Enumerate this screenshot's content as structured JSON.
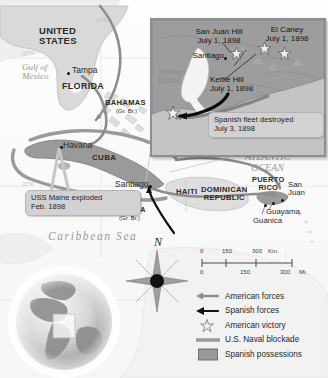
{
  "map": {
    "title": "Spanish-American War in the Caribbean, 1898",
    "colors": {
      "spanish_possession": "#9a9a9a",
      "land": "#d9d9d9",
      "water": "#fbfbfb",
      "american_forces": "#8d8d8d",
      "spanish_forces": "#111111",
      "blockade": "#8d8d8d",
      "callout_fill": "#d2d2d2",
      "inset_fill": "#c9c9c9"
    },
    "grid_labels": [
      {
        "text": "80°W",
        "x": 96,
        "y": 17
      },
      {
        "text": "30°N",
        "x": 22,
        "y": 50
      },
      {
        "text": "20°N",
        "x": 22,
        "y": 181
      }
    ],
    "place_labels": [
      {
        "name": "united-states",
        "text": "UNITED\nSTATES",
        "x": 39,
        "y": 26,
        "size": 9.5,
        "style": "country"
      },
      {
        "name": "florida",
        "text": "FLORIDA",
        "x": 62,
        "y": 82,
        "size": 9,
        "style": "country"
      },
      {
        "name": "tampa",
        "text": "Tampa",
        "x": 72,
        "y": 69,
        "size": 8.5,
        "style": "plain"
      },
      {
        "name": "gulf-of-mexico",
        "text": "Gulf of\nMexico",
        "x": 22,
        "y": 68,
        "size": 9,
        "style": "sea"
      },
      {
        "name": "bahamas",
        "text": "BAHAMAS",
        "x": 105,
        "y": 101,
        "size": 7.6,
        "style": "country"
      },
      {
        "name": "bahamas-sub",
        "text": "(Gr. Br.)",
        "x": 116,
        "y": 110,
        "size": 6,
        "style": "plain"
      },
      {
        "name": "havana",
        "text": "Havana",
        "x": 63,
        "y": 144,
        "size": 8.5,
        "style": "plain"
      },
      {
        "name": "cuba",
        "text": "CUBA",
        "x": 92,
        "y": 156,
        "size": 8,
        "style": "country"
      },
      {
        "name": "santiago",
        "text": "Santiago",
        "x": 118,
        "y": 178,
        "size": 8.5,
        "style": "plain"
      },
      {
        "name": "jamaica",
        "text": "JAMAICA",
        "x": 111,
        "y": 208,
        "size": 7.2,
        "style": "country"
      },
      {
        "name": "jamaica-sub",
        "text": "(Gr. Br.)",
        "x": 119,
        "y": 217,
        "size": 6,
        "style": "plain"
      },
      {
        "name": "haiti",
        "text": "HAITI",
        "x": 178,
        "y": 190,
        "size": 7.6,
        "style": "country"
      },
      {
        "name": "dominican-republic",
        "text": "DOMINICAN\nREPUBLIC",
        "x": 204,
        "y": 190,
        "size": 7.6,
        "style": "country"
      },
      {
        "name": "puerto-rico",
        "text": "PUERTO\nRICO",
        "x": 253,
        "y": 179,
        "size": 7.4,
        "style": "country"
      },
      {
        "name": "san-juan",
        "text": "San\nJuan",
        "x": 287,
        "y": 183,
        "size": 7.8,
        "style": "plain"
      },
      {
        "name": "guayama",
        "text": "Guayama",
        "x": 264,
        "y": 208,
        "size": 7.8,
        "style": "plain"
      },
      {
        "name": "guanica",
        "text": "Guánica",
        "x": 256,
        "y": 217,
        "size": 7.8,
        "style": "plain"
      },
      {
        "name": "atlantic-ocean",
        "text": "ATLANTIC\nOCEAN",
        "x": 245,
        "y": 158,
        "size": 10,
        "style": "sea"
      },
      {
        "name": "caribbean-sea",
        "text": "Caribbean Sea",
        "x": 53,
        "y": 235,
        "size": 11,
        "style": "sea"
      }
    ],
    "city_dots": [
      {
        "name": "tampa-dot",
        "x": 67,
        "y": 72
      },
      {
        "name": "havana-dot",
        "x": 61,
        "y": 146
      },
      {
        "name": "santiago-dot",
        "x": 149,
        "y": 185
      },
      {
        "name": "san-juan-dot",
        "x": 280,
        "y": 200
      },
      {
        "name": "guayama-dot",
        "x": 272,
        "y": 203
      },
      {
        "name": "guanica-dot",
        "x": 265,
        "y": 205
      }
    ],
    "callouts": [
      {
        "name": "uss-maine-callout",
        "line1": "USS Maine exploded",
        "line2": "Feb. 1898",
        "x": 25,
        "y": 190,
        "w": 104
      }
    ],
    "compass": {
      "label": "N",
      "x": 155,
      "y": 238
    }
  },
  "inset": {
    "name": "santiago-battle-inset",
    "x": 150,
    "y": 18,
    "w": 172,
    "h": 135,
    "labels": [
      {
        "name": "san-juan-hill",
        "text": "San Juan Hill",
        "sub": "July 1, 1898",
        "x": 32,
        "y": 10
      },
      {
        "name": "el-caney",
        "text": "El Caney",
        "sub": "July 1, 1898",
        "x": 108,
        "y": 8
      },
      {
        "name": "kettle-hill",
        "text": "Kettle Hill",
        "sub": "July 1, 1898",
        "x": 60,
        "y": 60
      },
      {
        "name": "santiago-inset",
        "text": "Santiago",
        "sub": "",
        "x": 48,
        "y": 36
      },
      {
        "name": "santiago-harbor",
        "text": "Santiago",
        "sub": "Harbor",
        "x": 20,
        "y": 52
      }
    ],
    "callout": {
      "name": "spanish-fleet-callout",
      "line1": "Spanish fleet destroyed",
      "line2": "July 3, 1898",
      "x": 58,
      "y": 95,
      "w": 104
    },
    "victory_stars": [
      {
        "name": "star-san-juan-hill",
        "x": 84,
        "y": 33
      },
      {
        "name": "star-kettle-hill",
        "x": 112,
        "y": 28
      },
      {
        "name": "star-el-caney",
        "x": 132,
        "y": 33
      },
      {
        "name": "star-fleet",
        "x": 21,
        "y": 92
      }
    ],
    "santiago_dot": {
      "x": 72,
      "y": 37
    }
  },
  "scale": {
    "name": "scale-bar",
    "km_label": "Km.",
    "mi_label": "Mi.",
    "km_ticks": [
      "0",
      "150",
      "300"
    ],
    "mi_ticks": [
      "0",
      "150",
      "300"
    ]
  },
  "legend": {
    "name": "map-legend",
    "items": [
      {
        "name": "legend-american-forces",
        "label": "American forces",
        "symbol": "arrow-light",
        "color": "#8d8d8d"
      },
      {
        "name": "legend-spanish-forces",
        "label": "Spanish forces",
        "symbol": "arrow-dark",
        "color": "#111111"
      },
      {
        "name": "legend-american-victory",
        "label": "American victory",
        "symbol": "star",
        "color": "#e8e8e8"
      },
      {
        "name": "legend-naval-blockade",
        "label": "U.S. Naval blockade",
        "symbol": "thick-line",
        "color": "#9a9a9a"
      },
      {
        "name": "legend-spanish-possessions",
        "label": "Spanish possessions",
        "symbol": "swatch",
        "color": "#9a9a9a"
      }
    ]
  },
  "globe": {
    "name": "globe-locator-inset",
    "x": 6,
    "y": 268,
    "size": 118
  }
}
